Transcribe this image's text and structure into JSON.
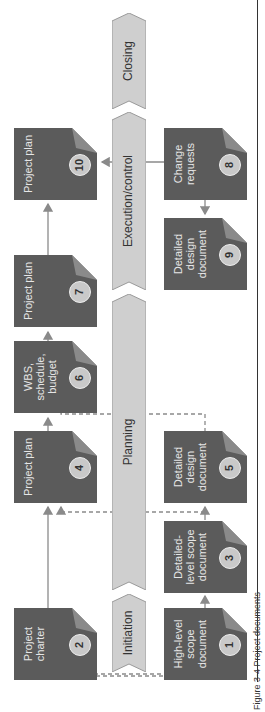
{
  "diagram": {
    "orientation": "rotated-90-ccw",
    "colors": {
      "document_fill": "#5b5b5b",
      "document_fold": "#8a8a8a",
      "document_text": "#e6e6e6",
      "badge_fill": "#c9c9c9",
      "phase_fill": "#cfcfcf",
      "phase_stroke": "#9a9a9a",
      "connector": "#8a8a8a"
    },
    "phases": [
      {
        "id": "initiation",
        "label": "Initiation"
      },
      {
        "id": "planning",
        "label": "Planning"
      },
      {
        "id": "execution",
        "label": "Execution/control"
      },
      {
        "id": "closing",
        "label": "Closing"
      }
    ],
    "documents": [
      {
        "number": "1",
        "label": "High-level scope document",
        "lane": "bottom",
        "phase": "initiation"
      },
      {
        "number": "2",
        "label": "Project charter",
        "lane": "top",
        "phase": "initiation"
      },
      {
        "number": "3",
        "label": "Detailed-level scope document",
        "lane": "bottom",
        "phase": "planning"
      },
      {
        "number": "4",
        "label": "Project plan",
        "lane": "top",
        "phase": "planning"
      },
      {
        "number": "5",
        "label": "Detailed design document",
        "lane": "bottom",
        "phase": "planning"
      },
      {
        "number": "6",
        "label": "WBS, schedule, budget",
        "lane": "top",
        "phase": "planning"
      },
      {
        "number": "7",
        "label": "Project plan",
        "lane": "top",
        "phase": "planning"
      },
      {
        "number": "8",
        "label": "Change requests",
        "lane": "bottom",
        "phase": "execution"
      },
      {
        "number": "9",
        "label": "Detailed design document",
        "lane": "bottom",
        "phase": "execution"
      },
      {
        "number": "10",
        "label": "Project plan",
        "lane": "top",
        "phase": "execution"
      }
    ],
    "connections": [
      {
        "from": "1",
        "to": "2",
        "style": "dashed"
      },
      {
        "from": "1",
        "to": "3",
        "style": "solid"
      },
      {
        "from": "2",
        "to": "4",
        "style": "solid"
      },
      {
        "from": "3",
        "to": "5",
        "style": "solid"
      },
      {
        "from": "3",
        "to": "4",
        "style": "dashed"
      },
      {
        "from": "4",
        "to": "6",
        "style": "solid"
      },
      {
        "from": "5",
        "to": "6",
        "style": "dashed"
      },
      {
        "from": "6",
        "to": "7",
        "style": "solid"
      },
      {
        "from": "7",
        "to": "10",
        "style": "solid"
      },
      {
        "from": "8",
        "to": "9",
        "style": "solid"
      },
      {
        "from": "8",
        "to": "10",
        "style": "solid"
      }
    ],
    "caption": "Figure 3-4  Project documents"
  }
}
